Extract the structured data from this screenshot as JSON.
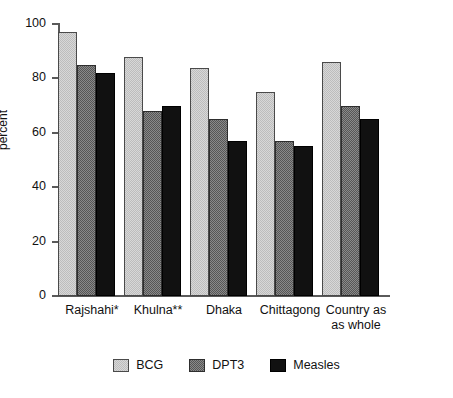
{
  "chart_data": {
    "type": "bar",
    "title": "",
    "xlabel": "",
    "ylabel": "percent",
    "ylim": [
      0,
      100
    ],
    "yticks": [
      0,
      20,
      40,
      60,
      80,
      100
    ],
    "ytick_labels": [
      "0",
      "20",
      "40",
      "60",
      "80",
      "100"
    ],
    "grid": false,
    "legend_position": "bottom-center",
    "categories": [
      "Rajshahi*",
      "Khulna**",
      "Dhaka",
      "Chittagong",
      "Country as as whole"
    ],
    "category_lines": [
      [
        "Rajshahi*"
      ],
      [
        "Khulna**"
      ],
      [
        "Dhaka"
      ],
      [
        "Chittagong"
      ],
      [
        "Country as",
        "as whole"
      ]
    ],
    "series": [
      {
        "name": "BCG",
        "color": "#c9c9c9",
        "values": [
          97,
          88,
          84,
          75,
          86
        ]
      },
      {
        "name": "DPT3",
        "color": "#6e6e6e",
        "values": [
          85,
          68,
          65,
          57,
          70
        ]
      },
      {
        "name": "Measles",
        "color": "#111111",
        "values": [
          82,
          70,
          57,
          55,
          65
        ]
      }
    ]
  },
  "legend": {
    "items": [
      {
        "label": "BCG"
      },
      {
        "label": "DPT3"
      },
      {
        "label": "Measles"
      }
    ]
  },
  "axis": {
    "y_title": "percent"
  }
}
